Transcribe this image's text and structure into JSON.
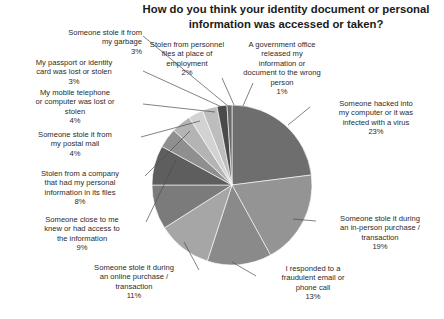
{
  "title": "How do you think your identity document\nor personal information was accessed or taken?",
  "chart_data": {
    "type": "pie",
    "title": "How do you think your identity document or personal information was accessed or taken?",
    "xlabel": "",
    "ylabel": "",
    "legend_position": "none",
    "grid": false,
    "units": "percent",
    "start_angle_deg": 0,
    "direction": "clockwise",
    "categories": [
      "Someone hacked into my computer or it was infected with a virus",
      "Someone stole it during an in-person purchase / transaction",
      "I responded to a fraudulent email or phone call",
      "Someone stole it during an online purchase / transaction",
      "Someone close to me knew or had access to the information",
      "Stolen from a company that had my personal information in its files",
      "Someone stole it from my postal mail",
      "My mobile telephone or computer was lost or stolen",
      "My passport or identity card was lost or stolen",
      "Someone stole it from my garbage",
      "Stolen from personnel files at place of employment",
      "A government office released my information or document to the wrong person"
    ],
    "values": [
      23,
      19,
      13,
      11,
      9,
      8,
      4,
      4,
      3,
      3,
      2,
      1
    ],
    "colors": [
      "#6e6e6e",
      "#949494",
      "#8a8a8a",
      "#a6a6a6",
      "#7b7b7b",
      "#5e5e5e",
      "#8f8f8f",
      "#b4b4b4",
      "#d2d2d2",
      "#bdbdbd",
      "#4a4a4a",
      "#6a6a6a"
    ]
  },
  "labels": {
    "garbage": "Someone stole it from\nmy garbage\n3%",
    "passport": "My passport or identity\ncard was lost or stolen\n3%",
    "mobile": "My mobile telephone\nor computer was lost or\nstolen\n4%",
    "postal": "Someone stole it from\nmy postal mail\n4%",
    "company": "Stolen from a company\nthat had my personal\ninformation in its files\n8%",
    "close": "Someone close to me\nknew or had access to\nthe information\n9%",
    "online": "Someone stole it during\nan online purchase /\ntransaction\n11%",
    "fraud": "I responded to a\nfraudulent email or\nphone call\n13%",
    "inperson": "Someone stole it during\nan in-person purchase /\ntransaction\n19%",
    "hacked": "Someone hacked into\nmy computer or it was\ninfected with a virus\n23%",
    "govt": "A government office\nreleased my\ninformation or\ndocument to the wrong\nperson\n1%",
    "personnel": "Stolen from personnel\nfiles at place of\nemployment\n2%"
  }
}
